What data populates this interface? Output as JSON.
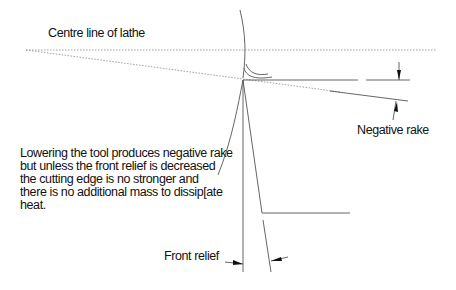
{
  "diagram": {
    "labels": {
      "centre_line": "Centre line of lathe",
      "negative_rake": "Negative rake",
      "front_relief": "Front relief"
    },
    "note_lines": [
      "Lowering the tool produces negative rake",
      "but unless the front relief is decreased",
      "the cutting edge is no stronger and",
      "there is no additional mass to dissip[ate",
      "heat."
    ],
    "colors": {
      "line": "#555555",
      "text": "#111111",
      "background": "#ffffff"
    }
  }
}
